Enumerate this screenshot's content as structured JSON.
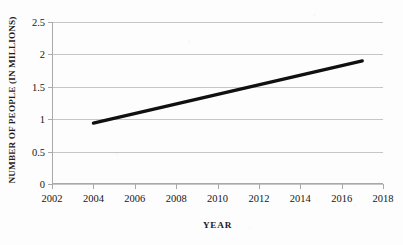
{
  "chart_data": {
    "type": "line",
    "title": "",
    "xlabel": "YEAR",
    "ylabel": "NUMBER OF PEOPLE (IN MILLIONS)",
    "x": [
      2004,
      2017
    ],
    "values": [
      0.94,
      1.9
    ],
    "series": [
      {
        "name": "number of people",
        "x": [
          2004,
          2017
        ],
        "values": [
          0.94,
          1.9
        ]
      }
    ],
    "xlim": [
      2002,
      2018
    ],
    "ylim": [
      0,
      2.5
    ],
    "xticks": [
      2002,
      2004,
      2006,
      2008,
      2010,
      2012,
      2014,
      2016,
      2018
    ],
    "xtick_labels": [
      "2002",
      "2004",
      "2006",
      "2008",
      "2010",
      "2012",
      "2014",
      "2016",
      "2018"
    ],
    "yticks": [
      0,
      0.5,
      1,
      1.5,
      2,
      2.5
    ],
    "ytick_labels": [
      "0",
      "0.5",
      "1",
      "1.5",
      "2",
      "2.5"
    ],
    "grid": "horizontal",
    "legend": "none",
    "line_color": "#101010",
    "line_width": 3.2,
    "marker": "round-cap-endpoints",
    "grid_color": "#c6c6c6",
    "axis_color": "#a9a9a9",
    "background_color": "#fdfdfd"
  }
}
